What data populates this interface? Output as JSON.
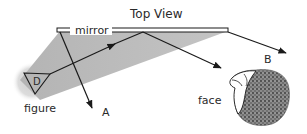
{
  "title": "Top View",
  "labels": {
    "mirror": "mirror",
    "figure": "figure",
    "face": "face",
    "figure_letter": "D",
    "ray_a": "A",
    "ray_b": "B"
  },
  "colors": {
    "cone": "#b8b8b8",
    "glow": "#d6d6d6",
    "line": "#1a1a1a",
    "hair": "#6a6a6a"
  }
}
